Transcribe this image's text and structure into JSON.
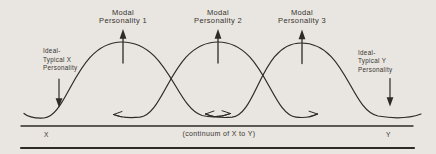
{
  "figure": {
    "colors": {
      "background": "#e9e6e1",
      "ink": "#2e2b27",
      "text": "#38342f"
    },
    "modal_labels": [
      {
        "line1": "Modal",
        "line2": "Personality 1"
      },
      {
        "line1": "Modal",
        "line2": "Personality 2"
      },
      {
        "line1": "Modal",
        "line2": "Personality 3"
      }
    ],
    "ideal_x": {
      "line1": "Ideal-",
      "line2": "Typical X",
      "line3": "Personality"
    },
    "ideal_y": {
      "line1": "Ideal-",
      "line2": "Typical Y",
      "line3": "Personality"
    },
    "axis": {
      "left_label": "X",
      "center_label": "(continuum of X to Y)",
      "right_label": "Y"
    }
  }
}
